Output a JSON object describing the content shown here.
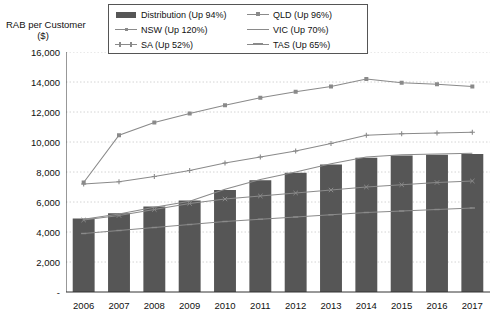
{
  "chart_data": {
    "type": "bar",
    "title": "",
    "ylabel": "RAB per Customer\n($)",
    "ylabel_line1": "RAB per Customer",
    "ylabel_line2": "($)",
    "xlabel": "",
    "ylim": [
      0,
      16000
    ],
    "ytick_values": [
      0,
      2000,
      4000,
      6000,
      8000,
      10000,
      12000,
      14000,
      16000
    ],
    "ytick_labels": [
      "-",
      "2,000",
      "4,000",
      "6,000",
      "8,000",
      "10,000",
      "12,000",
      "14,000",
      "16,000"
    ],
    "grid": true,
    "legend_position": "top-center",
    "categories": [
      "2006",
      "2007",
      "2008",
      "2009",
      "2010",
      "2011",
      "2012",
      "2013",
      "2014",
      "2015",
      "2016",
      "2017"
    ],
    "bar_series": {
      "name": "Distribution (Up 94%)",
      "kind": "bar",
      "color": "#565656",
      "values": [
        4900,
        5250,
        5700,
        6100,
        6800,
        7450,
        7950,
        8500,
        8950,
        9100,
        9150,
        9200
      ]
    },
    "series": [
      {
        "name": "NSW (Up 120%)",
        "kind": "line",
        "marker": "plus",
        "color": "#8a8a8a",
        "values": [
          7200,
          7350,
          7700,
          8100,
          8600,
          9000,
          9400,
          9900,
          10450,
          10550,
          10600,
          10650
        ]
      },
      {
        "name": "SA (Up 52%)",
        "kind": "line",
        "marker": "x",
        "color": "#8a8a8a",
        "values": [
          4800,
          5100,
          5500,
          5900,
          6200,
          6400,
          6600,
          6800,
          7000,
          7150,
          7300,
          7400
        ]
      },
      {
        "name": "QLD (Up 96%)",
        "kind": "line",
        "marker": "square",
        "color": "#8a8a8a",
        "values": [
          7300,
          10450,
          11300,
          11900,
          12450,
          12950,
          13350,
          13700,
          14200,
          13950,
          13850,
          13700
        ]
      },
      {
        "name": "VIC (Up 70%)",
        "kind": "line",
        "marker": "none",
        "color": "#8a8a8a",
        "values": [
          4850,
          5200,
          5650,
          6050,
          6850,
          7500,
          8000,
          8550,
          9000,
          9150,
          9200,
          9250
        ]
      },
      {
        "name": "TAS (Up 65%)",
        "kind": "line",
        "marker": "dash",
        "color": "#8a8a8a",
        "values": [
          3900,
          4100,
          4300,
          4500,
          4700,
          4850,
          5000,
          5150,
          5300,
          5400,
          5500,
          5600
        ]
      }
    ],
    "legend_entries": [
      {
        "label": "Distribution (Up 94%)",
        "key": "bar"
      },
      {
        "label": "QLD (Up 96%)",
        "key": "line-square"
      },
      {
        "label": "NSW (Up 120%)",
        "key": "line-plus"
      },
      {
        "label": "VIC (Up 70%)",
        "key": "line-plain"
      },
      {
        "label": "SA (Up 52%)",
        "key": "line-x"
      },
      {
        "label": "TAS (Up 65%)",
        "key": "line-dash"
      }
    ]
  }
}
